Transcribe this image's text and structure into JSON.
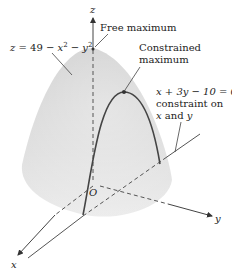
{
  "figure": {
    "surface_equation": {
      "z": "z",
      "eq": " = 49 − ",
      "x": "x",
      "x_exp": "2",
      "minus": " − ",
      "y": "y",
      "y_exp": "2"
    },
    "labels": {
      "free_maximum": "Free maximum",
      "constrained_line1": "Constrained",
      "constrained_line2": "maximum",
      "constraint_eq": "x + 3y − 10 = 0",
      "constraint_line2": "constraint on",
      "constraint_line3_x": "x",
      "constraint_line3_and": " and ",
      "constraint_line3_y": "y"
    },
    "axes": {
      "x": "x",
      "y": "y",
      "z": "z",
      "origin": "O"
    },
    "colors": {
      "surface_top": "#d4d4d4",
      "surface_bottom": "#e9e9e9",
      "line": "#555555",
      "curve": "#444444"
    }
  }
}
